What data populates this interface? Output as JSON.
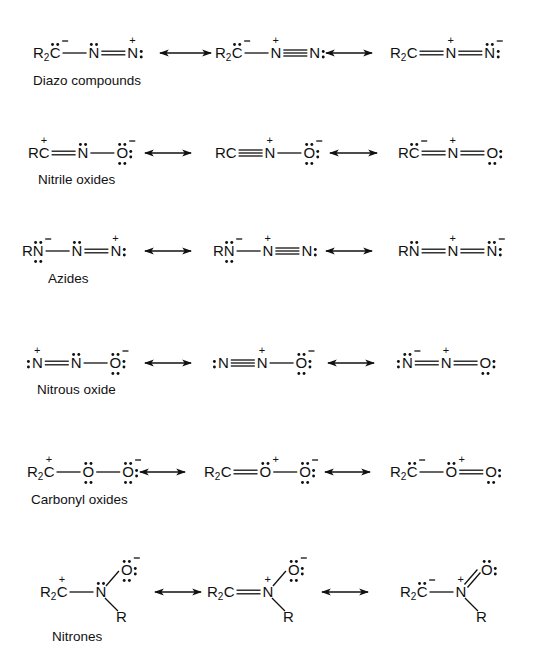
{
  "arrow_symbol": "resonance-double-arrow",
  "rows": [
    {
      "name": "Diazo compounds",
      "label": "Diazo compounds",
      "y": 53,
      "label_pos": [
        33,
        85
      ],
      "arrows": [
        [
          160,
          211
        ],
        [
          326,
          372
        ]
      ],
      "structures": [
        {
          "x": 33,
          "formula": "R2C(lp,-)—N(lp)=N(+):",
          "atoms": [
            {
              "t": "R",
              "sub": "2",
              "t2": "C",
              "lp": "top",
              "charge": "-"
            },
            {
              "t": "N",
              "lp": "top"
            },
            {
              "t": "N",
              "charge": "+",
              "lp": "right"
            }
          ],
          "bonds": [
            1,
            2
          ]
        },
        {
          "x": 215,
          "formula": "R2C(lp,-)—N(+)≡N:",
          "atoms": [
            {
              "t": "R",
              "sub": "2",
              "t2": "C",
              "lp": "top",
              "charge": "-"
            },
            {
              "t": "N",
              "charge": "+"
            },
            {
              "t": "N",
              "lp": "right"
            }
          ],
          "bonds": [
            1,
            3
          ]
        },
        {
          "x": 390,
          "formula": "R2C=N(+)=N(lp,-):",
          "atoms": [
            {
              "t": "R",
              "sub": "2",
              "t2": "C"
            },
            {
              "t": "N",
              "charge": "+"
            },
            {
              "t": "N",
              "lp": "top,right",
              "charge": "-"
            }
          ],
          "bonds": [
            2,
            2
          ]
        }
      ]
    },
    {
      "name": "Nitrile oxides",
      "label": "Nitrile oxides",
      "y": 153,
      "label_pos": [
        38,
        184
      ],
      "arrows": [
        [
          145,
          191
        ],
        [
          330,
          377
        ]
      ],
      "structures": [
        {
          "x": 28,
          "formula": "RC(+)=N(lp)—O(lp3,-)",
          "atoms": [
            {
              "t": "RC",
              "charge": "+"
            },
            {
              "t": "N",
              "lp": "top"
            },
            {
              "t": "O",
              "lp": "top,right,bottom",
              "charge": "-"
            }
          ],
          "bonds": [
            2,
            1
          ]
        },
        {
          "x": 215,
          "formula": "RC≡N(+)—O(lp3,-)",
          "atoms": [
            {
              "t": "RC"
            },
            {
              "t": "N",
              "charge": "+"
            },
            {
              "t": "O",
              "lp": "top,right,bottom",
              "charge": "-"
            }
          ],
          "bonds": [
            3,
            1
          ]
        },
        {
          "x": 398,
          "formula": "RC(lp,-)=N(+)=O(lp2)",
          "atoms": [
            {
              "t": "RC",
              "lp": "top",
              "charge": "-"
            },
            {
              "t": "N",
              "charge": "+"
            },
            {
              "t": "O",
              "lp": "right,bottom"
            }
          ],
          "bonds": [
            2,
            2
          ]
        }
      ]
    },
    {
      "name": "Azides",
      "label": "Azides",
      "y": 251,
      "label_pos": [
        48,
        283
      ],
      "arrows": [
        [
          145,
          191
        ],
        [
          326,
          372
        ]
      ],
      "structures": [
        {
          "x": 22,
          "formula": "RN(lp2,-)—N(lp)=N(+):",
          "atoms": [
            {
              "t": "RN",
              "lp": "top,bottom",
              "charge": "-"
            },
            {
              "t": "N",
              "lp": "top"
            },
            {
              "t": "N",
              "charge": "+",
              "lp": "right"
            }
          ],
          "bonds": [
            1,
            2
          ]
        },
        {
          "x": 213,
          "formula": "RN(lp2,-)—N(+)≡N:",
          "atoms": [
            {
              "t": "RN",
              "lp": "top,bottom",
              "charge": "-"
            },
            {
              "t": "N",
              "charge": "+"
            },
            {
              "t": "N",
              "lp": "right"
            }
          ],
          "bonds": [
            1,
            3
          ]
        },
        {
          "x": 398,
          "formula": "RN(lp)=N(+)=N(lp,-):",
          "atoms": [
            {
              "t": "RN",
              "lp": "top"
            },
            {
              "t": "N",
              "charge": "+"
            },
            {
              "t": "N",
              "lp": "top,right",
              "charge": "-"
            }
          ],
          "bonds": [
            2,
            2
          ]
        }
      ]
    },
    {
      "name": "Nitrous oxide",
      "label": "Nitrous oxide",
      "y": 363,
      "label_pos": [
        37,
        394
      ],
      "arrows": [
        [
          145,
          191
        ],
        [
          328,
          374
        ]
      ],
      "structures": [
        {
          "x": 26,
          "formula": ":N(+)=N(lp)—O(lp3,-)",
          "atoms": [
            {
              "t": "N",
              "lp": "left",
              "charge": "+"
            },
            {
              "t": "N",
              "lp": "top"
            },
            {
              "t": "O",
              "lp": "top,right,bottom",
              "charge": "-"
            }
          ],
          "bonds": [
            2,
            1
          ]
        },
        {
          "x": 212,
          "formula": ":N≡N(+)—O(lp3,-)",
          "atoms": [
            {
              "t": "N",
              "lp": "left"
            },
            {
              "t": "N",
              "charge": "+"
            },
            {
              "t": "O",
              "lp": "top,right,bottom",
              "charge": "-"
            }
          ],
          "bonds": [
            3,
            1
          ]
        },
        {
          "x": 396,
          "formula": ":N(lp,-)=N(+)=O(lp2):",
          "atoms": [
            {
              "t": "N",
              "lp": "left,top",
              "charge": "-"
            },
            {
              "t": "N",
              "charge": "+"
            },
            {
              "t": "O",
              "lp": "right,bottom"
            }
          ],
          "bonds": [
            2,
            2
          ]
        }
      ]
    },
    {
      "name": "Carbonyl oxides",
      "label": "Carbonyl oxides",
      "y": 472,
      "label_pos": [
        31,
        504
      ],
      "arrows": [
        [
          140,
          185
        ],
        [
          325,
          370
        ]
      ],
      "structures": [
        {
          "x": 27,
          "formula": "R2C(+)—O(lp2)—O(lp3,-)",
          "atoms": [
            {
              "t": "R",
              "sub": "2",
              "t2": "C",
              "charge": "+"
            },
            {
              "t": "O",
              "lp": "top,bottom"
            },
            {
              "t": "O",
              "lp": "top,right,bottom",
              "charge": "-"
            }
          ],
          "bonds": [
            1,
            1
          ]
        },
        {
          "x": 204,
          "formula": "R2C=O(lp,+)—O(lp3,-)",
          "atoms": [
            {
              "t": "R",
              "sub": "2",
              "t2": "C"
            },
            {
              "t": "O",
              "lp": "top",
              "charge": "+"
            },
            {
              "t": "O",
              "lp": "top,right,bottom",
              "charge": "-"
            }
          ],
          "bonds": [
            2,
            1
          ]
        },
        {
          "x": 390,
          "formula": "R2C(lp,-)—O(lp,+)=O(lp2):",
          "atoms": [
            {
              "t": "R",
              "sub": "2",
              "t2": "C",
              "lp": "top",
              "charge": "-"
            },
            {
              "t": "O",
              "lp": "top",
              "charge": "+"
            },
            {
              "t": "O",
              "lp": "right,bottom"
            }
          ],
          "bonds": [
            1,
            2
          ]
        }
      ]
    },
    {
      "name": "Nitrones",
      "label": "Nitrones",
      "y": 592,
      "label_pos": [
        52,
        641
      ],
      "arrows": [
        [
          155,
          201
        ],
        [
          322,
          368
        ]
      ],
      "structures": [
        {
          "x": 40,
          "formula": "R2C(+)—N(lp)(R)—O(lp3,-)",
          "atoms": [
            {
              "t": "R",
              "sub": "2",
              "t2": "C",
              "charge": "+"
            },
            {
              "t": "N",
              "lp": "top"
            },
            {
              "t": "O",
              "lp": "top,right,bottom",
              "charge": "-"
            },
            {
              "t": "R"
            }
          ],
          "bonds": [
            1,
            1,
            1
          ]
        },
        {
          "x": 207,
          "formula": "R2C=N(+)(R)—O(lp3,-)",
          "atoms": [
            {
              "t": "R",
              "sub": "2",
              "t2": "C"
            },
            {
              "t": "N",
              "charge": "+"
            },
            {
              "t": "O",
              "lp": "top,right,bottom",
              "charge": "-"
            },
            {
              "t": "R"
            }
          ],
          "bonds": [
            2,
            1,
            1
          ]
        },
        {
          "x": 400,
          "formula": "R2C(lp,-)—N(+)(R)=O(lp2)",
          "atoms": [
            {
              "t": "R",
              "sub": "2",
              "t2": "C",
              "lp": "top",
              "charge": "-"
            },
            {
              "t": "N",
              "charge": "+"
            },
            {
              "t": "O",
              "lp": "top,right"
            },
            {
              "t": "R"
            }
          ],
          "bonds": [
            1,
            2,
            1
          ]
        }
      ]
    }
  ]
}
